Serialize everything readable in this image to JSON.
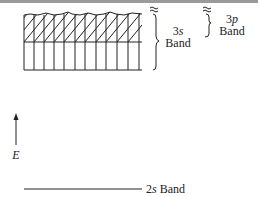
{
  "diagram": {
    "title": "",
    "bands": {
      "band_3s": {
        "orbital": "3",
        "orbital_letter": "s",
        "word": "Band"
      },
      "band_3p": {
        "orbital": "3",
        "orbital_letter": "p",
        "word": "Band"
      },
      "band_2s": {
        "orbital": "2",
        "orbital_letter": "s",
        "word": "Band"
      }
    },
    "axis": {
      "label": "E",
      "direction": "up"
    },
    "grid": {
      "columns": 12,
      "lower_section": "vertical-lines",
      "upper_section": "hatched-diagonal"
    },
    "colors": {
      "line": "#222222",
      "background": "#ffffff",
      "top_bar": "#9a9a9a"
    }
  }
}
